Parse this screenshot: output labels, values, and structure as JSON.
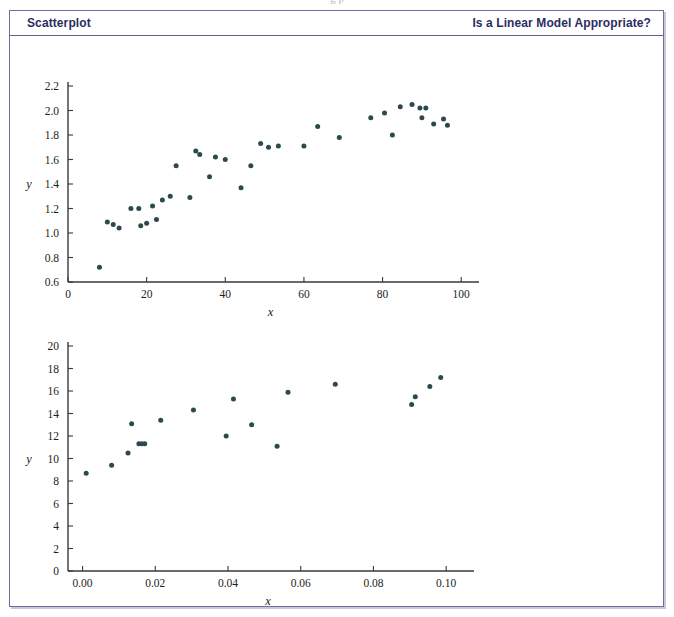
{
  "page": {
    "top_cutoff_text": "g    p",
    "frame_color": "#6c6f9e",
    "header_text_color": "#2b2d62",
    "point_color": "#2b4a4e"
  },
  "header": {
    "title": "Scatterplot",
    "right_title": "Is a Linear Model Appropriate?"
  },
  "chart_data": [
    {
      "id": "scatterplot-top",
      "type": "scatter",
      "title": "",
      "xlabel": "x",
      "ylabel": "y",
      "xlim": [
        0,
        103
      ],
      "ylim": [
        0.6,
        2.2
      ],
      "xticks": [
        0,
        20,
        40,
        60,
        80,
        100
      ],
      "xticklabels": [
        "0",
        "20",
        "40",
        "60",
        "80",
        "100"
      ],
      "yticks": [
        0.6,
        0.8,
        1.0,
        1.2,
        1.4,
        1.6,
        1.8,
        2.0,
        2.2
      ],
      "yticklabels": [
        "0.6",
        "0.8",
        "1.0",
        "1.2",
        "1.4",
        "1.6",
        "1.8",
        "2.0",
        "2.2"
      ],
      "grid": false,
      "legend": "none",
      "points": [
        [
          8,
          0.72
        ],
        [
          10,
          1.09
        ],
        [
          11.5,
          1.07
        ],
        [
          13,
          1.04
        ],
        [
          16,
          1.2
        ],
        [
          18,
          1.2
        ],
        [
          18.5,
          1.06
        ],
        [
          20,
          1.08
        ],
        [
          21.5,
          1.22
        ],
        [
          22.5,
          1.11
        ],
        [
          24,
          1.27
        ],
        [
          26,
          1.3
        ],
        [
          27.5,
          1.55
        ],
        [
          31,
          1.29
        ],
        [
          32.5,
          1.67
        ],
        [
          33.5,
          1.64
        ],
        [
          36,
          1.46
        ],
        [
          37.5,
          1.62
        ],
        [
          40,
          1.6
        ],
        [
          44,
          1.37
        ],
        [
          46.5,
          1.55
        ],
        [
          49,
          1.73
        ],
        [
          51,
          1.7
        ],
        [
          53.5,
          1.71
        ],
        [
          60,
          1.71
        ],
        [
          63.5,
          1.87
        ],
        [
          69,
          1.78
        ],
        [
          77,
          1.94
        ],
        [
          80.5,
          1.98
        ],
        [
          82.5,
          1.8
        ],
        [
          84.5,
          2.03
        ],
        [
          87.5,
          2.05
        ],
        [
          89.5,
          2.02
        ],
        [
          91,
          2.02
        ],
        [
          90,
          1.94
        ],
        [
          93,
          1.89
        ],
        [
          95.5,
          1.93
        ],
        [
          96.5,
          1.88
        ]
      ]
    },
    {
      "id": "scatterplot-bottom",
      "type": "scatter",
      "title": "",
      "xlabel": "x",
      "ylabel": "y",
      "xlim": [
        -0.004,
        0.106
      ],
      "ylim": [
        0,
        20
      ],
      "xticks": [
        0.0,
        0.02,
        0.04,
        0.06,
        0.08,
        0.1
      ],
      "xticklabels": [
        "0.00",
        "0.02",
        "0.04",
        "0.06",
        "0.08",
        "0.10"
      ],
      "yticks": [
        0,
        2,
        4,
        6,
        8,
        10,
        12,
        14,
        16,
        18,
        20
      ],
      "yticklabels": [
        "0",
        "2",
        "4",
        "6",
        "8",
        "10",
        "12",
        "14",
        "16",
        "18",
        "20"
      ],
      "grid": false,
      "legend": "none",
      "points": [
        [
          0.001,
          8.7
        ],
        [
          0.008,
          9.4
        ],
        [
          0.0125,
          10.5
        ],
        [
          0.0135,
          13.1
        ],
        [
          0.0155,
          11.3
        ],
        [
          0.0163,
          11.3
        ],
        [
          0.0171,
          11.3
        ],
        [
          0.0215,
          13.4
        ],
        [
          0.0305,
          14.3
        ],
        [
          0.0395,
          12.0
        ],
        [
          0.0415,
          15.3
        ],
        [
          0.0465,
          13.0
        ],
        [
          0.0535,
          11.1
        ],
        [
          0.0565,
          15.9
        ],
        [
          0.0695,
          16.6
        ],
        [
          0.0905,
          14.8
        ],
        [
          0.0915,
          15.5
        ],
        [
          0.0955,
          16.4
        ],
        [
          0.0985,
          17.2
        ]
      ]
    }
  ]
}
